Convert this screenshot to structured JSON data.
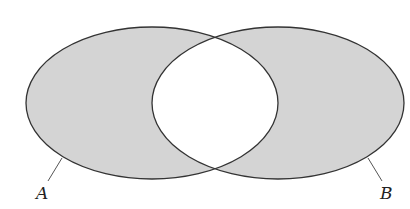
{
  "diagram": {
    "type": "venn",
    "shaded_region": "symmetric difference (A xor B)",
    "colors": {
      "fill": "#d4d4d4",
      "stroke": "#333333",
      "background": "#ffffff",
      "intersection": "#ffffff"
    },
    "sets": [
      {
        "name": "A",
        "label": "A",
        "cx": 152,
        "cy": 103,
        "rx": 126,
        "ry": 76
      },
      {
        "name": "B",
        "label": "B",
        "cx": 278,
        "cy": 103,
        "rx": 126,
        "ry": 76
      }
    ]
  }
}
